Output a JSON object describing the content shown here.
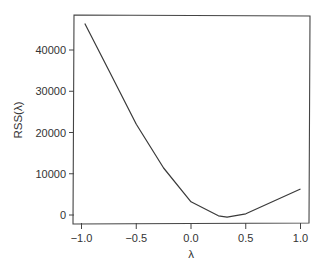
{
  "chart_data": {
    "type": "line",
    "title": "",
    "xlabel": "λ",
    "ylabel": "RSS(λ)",
    "xlim": [
      -1.05,
      1.07
    ],
    "ylim": [
      -2000,
      48000
    ],
    "grid": false,
    "legend": null,
    "x_ticks": [
      -1.0,
      -0.5,
      0.0,
      0.5,
      1.0
    ],
    "x_tick_labels": [
      "−1.0",
      "−0.5",
      "0.0",
      "0.5",
      "1.0"
    ],
    "y_ticks": [
      0,
      10000,
      20000,
      30000,
      40000
    ],
    "y_tick_labels": [
      "0",
      "10000",
      "20000",
      "30000",
      "40000"
    ],
    "series": [
      {
        "name": "RSS(λ)",
        "color": "#3a3a3a",
        "x": [
          -0.97,
          -0.75,
          -0.5,
          -0.25,
          0.0,
          0.25,
          0.33,
          0.5,
          1.0
        ],
        "y": [
          46400,
          35000,
          22000,
          11400,
          3200,
          -200,
          -500,
          300,
          6300
        ]
      }
    ]
  },
  "colors": {
    "axis": "#444444",
    "line": "#3a3a3a",
    "text": "#333333",
    "background": "#ffffff"
  }
}
